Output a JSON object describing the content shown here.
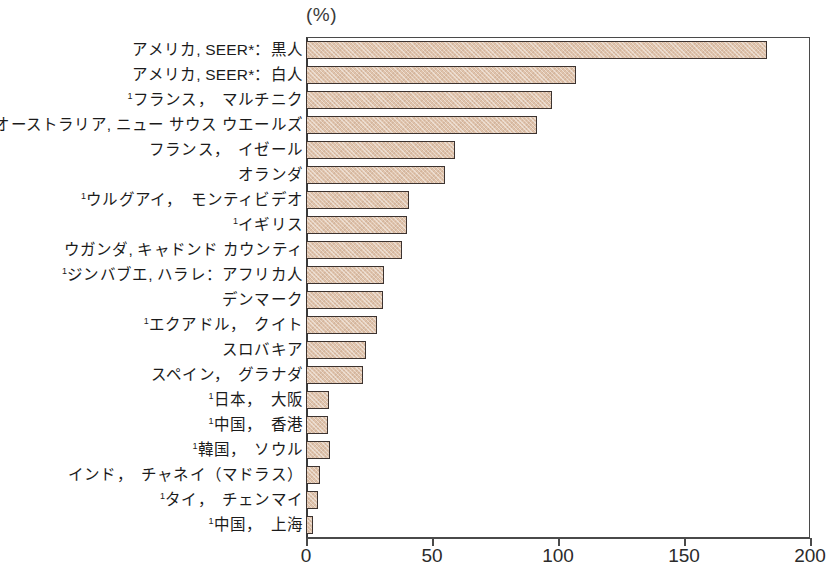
{
  "chart_data": {
    "type": "bar",
    "orientation": "horizontal",
    "title": "",
    "unit_label": "(%)",
    "xlabel": "",
    "ylabel": "",
    "xlim": [
      0,
      200
    ],
    "xticks": [
      0,
      50,
      100,
      150,
      200
    ],
    "xtick_labels": [
      "0",
      "50",
      "100",
      "150",
      "200"
    ],
    "grid": false,
    "legend": "none",
    "highlight_category": "¹日本，大阪",
    "colors": {
      "bar_fill": "#dfc3ac",
      "bar_edge": "#3c3330",
      "highlight_fill": "#9c6628",
      "highlight_label": "#b5825a",
      "axis": "#4a4a4a",
      "text": "#1b1b1b"
    },
    "categories": [
      "アメリカ, SEER*：黒人",
      "アメリカ, SEER*：白人",
      "¹フランス，　マルチニク",
      "オーストラリア, ニュー サウス ウエールズ",
      "フランス，　イゼール",
      "オランダ",
      "¹ウルグアイ，　モンティビデオ",
      "¹イギリス",
      "ウガンダ, キャドンド カウンティ",
      "¹ジンバブエ, ハラレ：アフリカ人",
      "デンマーク",
      "¹エクアドル，　クイト",
      "スロバキア",
      "スペイン，　グラナダ",
      "¹日本，　大阪",
      "¹中国，　香港",
      "¹韓国，　ソウル",
      "インド，　チャネイ（マドラス）",
      "¹タイ，　チェンマイ",
      "¹中国，　上海"
    ],
    "values": [
      183,
      107,
      97.5,
      91.5,
      59,
      55,
      41,
      40,
      38,
      31,
      30.5,
      28,
      24,
      22.5,
      9.1,
      8.9,
      9.5,
      5.5,
      4.8,
      2.8
    ]
  }
}
